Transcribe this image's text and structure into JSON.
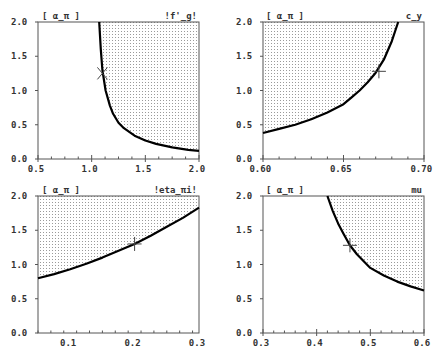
{
  "chart_data": [
    {
      "type": "line",
      "title": "",
      "corner_label_left": "[ α_π ]",
      "corner_label_right": "!f'_g!",
      "xlabel": "f'_g",
      "ylabel": "α_π",
      "xlim": [
        0.5,
        2.0
      ],
      "ylim": [
        0.0,
        2.0
      ],
      "xticks": [
        "0.5",
        "1.0",
        "1.5",
        "2.0"
      ],
      "xtick_values": [
        0.5,
        1.0,
        1.5,
        2.0
      ],
      "yticks": [
        "0.0",
        "0.5",
        "1.0",
        "1.5",
        "2.0"
      ],
      "ytick_values": [
        0.0,
        0.5,
        1.0,
        1.5,
        2.0
      ],
      "minor_xticks": 3,
      "shade_side": "right",
      "x": [
        1.07,
        1.085,
        1.1,
        1.13,
        1.17,
        1.2,
        1.25,
        1.3,
        1.4,
        1.5,
        1.6,
        1.75,
        1.9,
        2.0
      ],
      "y": [
        2.0,
        1.6,
        1.3,
        1.0,
        0.78,
        0.66,
        0.53,
        0.45,
        0.34,
        0.27,
        0.22,
        0.17,
        0.135,
        0.12
      ],
      "marker": {
        "symbol": "x",
        "x": 1.1,
        "y": 1.25
      }
    },
    {
      "type": "line",
      "title": "",
      "corner_label_left": "[ α_π ]",
      "corner_label_right": "c_y",
      "xlabel": "c_y",
      "ylabel": "α_π",
      "xlim": [
        0.6,
        0.7
      ],
      "ylim": [
        0.0,
        2.0
      ],
      "xticks": [
        "0.60",
        "0.65",
        "0.70"
      ],
      "xtick_values": [
        0.6,
        0.65,
        0.7
      ],
      "yticks": [
        "0.0",
        "0.5",
        "1.0",
        "1.5",
        "2.0"
      ],
      "ytick_values": [
        0.0,
        0.5,
        1.0,
        1.5,
        2.0
      ],
      "minor_xticks": 4,
      "shade_side": "left",
      "x": [
        0.6,
        0.61,
        0.62,
        0.63,
        0.64,
        0.65,
        0.655,
        0.66,
        0.665,
        0.67,
        0.675,
        0.68,
        0.684
      ],
      "y": [
        0.38,
        0.44,
        0.5,
        0.58,
        0.68,
        0.8,
        0.9,
        1.0,
        1.12,
        1.26,
        1.45,
        1.72,
        2.0
      ],
      "marker": {
        "symbol": "+",
        "x": 0.672,
        "y": 1.28
      }
    },
    {
      "type": "line",
      "title": "",
      "corner_label_left": "[ α_π ]",
      "corner_label_right": "!eta_πi!",
      "xlabel": "eta_πi",
      "ylabel": "α_π",
      "xlim": [
        0.05,
        0.3
      ],
      "ylim": [
        0.0,
        2.0
      ],
      "xticks": [
        "0.1",
        "0.2",
        "0.3"
      ],
      "xtick_values": [
        0.1,
        0.2,
        0.3
      ],
      "yticks": [
        "0.0",
        "0.5",
        "1.0",
        "1.5",
        "2.0"
      ],
      "ytick_values": [
        0.0,
        0.5,
        1.0,
        1.5,
        2.0
      ],
      "minor_xticks": 4,
      "shade_side": "above",
      "x": [
        0.05,
        0.075,
        0.1,
        0.125,
        0.15,
        0.175,
        0.2,
        0.225,
        0.25,
        0.275,
        0.3
      ],
      "y": [
        0.8,
        0.86,
        0.93,
        1.01,
        1.1,
        1.2,
        1.3,
        1.42,
        1.55,
        1.68,
        1.83
      ],
      "marker": {
        "symbol": "+",
        "x": 0.2,
        "y": 1.3
      }
    },
    {
      "type": "line",
      "title": "",
      "corner_label_left": "[ α_π ]",
      "corner_label_right": "mu",
      "xlabel": "mu",
      "ylabel": "α_π",
      "xlim": [
        0.3,
        0.6
      ],
      "ylim": [
        0.0,
        2.0
      ],
      "xticks": [
        "0.3",
        "0.4",
        "0.5",
        "0.6"
      ],
      "xtick_values": [
        0.3,
        0.4,
        0.5,
        0.6
      ],
      "yticks": [
        "0.0",
        "0.5",
        "1.0",
        "1.5",
        "2.0"
      ],
      "ytick_values": [
        0.0,
        0.5,
        1.0,
        1.5,
        2.0
      ],
      "minor_xticks": 4,
      "shade_side": "right",
      "x": [
        0.42,
        0.43,
        0.44,
        0.45,
        0.462,
        0.475,
        0.5,
        0.525,
        0.55,
        0.575,
        0.6
      ],
      "y": [
        2.0,
        1.78,
        1.6,
        1.45,
        1.28,
        1.15,
        0.95,
        0.84,
        0.75,
        0.68,
        0.62
      ],
      "marker": {
        "symbol": "+",
        "x": 0.462,
        "y": 1.28
      }
    }
  ],
  "layout": {
    "panels": [
      {
        "left": 38,
        "top": 22,
        "right": 199,
        "bottom": 159
      },
      {
        "left": 263,
        "top": 22,
        "right": 424,
        "bottom": 159
      },
      {
        "left": 38,
        "top": 196,
        "right": 199,
        "bottom": 333
      },
      {
        "left": 263,
        "top": 196,
        "right": 424,
        "bottom": 333
      }
    ]
  },
  "colors": {
    "axis": "#555555",
    "curve": "#000000",
    "shade_dot": "#9a9a9a",
    "text": "#333333"
  }
}
